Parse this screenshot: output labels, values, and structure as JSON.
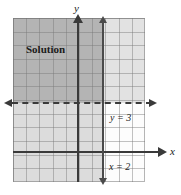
{
  "figure": {
    "type": "coordinate-plane-inequality-graph",
    "axis_labels": {
      "x": "x",
      "y": "y"
    },
    "region_label": "Solution",
    "boundary_lines": [
      {
        "id": "y3",
        "label": "y = 3",
        "style": "dashed",
        "orientation": "horizontal",
        "value": 3
      },
      {
        "id": "x2",
        "label": "x = 2",
        "style": "solid",
        "orientation": "vertical",
        "value": 2
      }
    ]
  },
  "chart_data": {
    "type": "line",
    "title": "",
    "xlabel": "x",
    "ylabel": "y",
    "grid": true,
    "legend": "none",
    "xlim": [
      -5,
      5
    ],
    "ylim": [
      -2,
      10
    ],
    "annotations": [
      {
        "text": "Solution",
        "x": -4,
        "y": 8
      },
      {
        "text": "y = 3",
        "x": 2.6,
        "y": 2.4
      },
      {
        "text": "x = 2",
        "x": 2.6,
        "y": -0.8
      }
    ],
    "series": [
      {
        "name": "y = 3",
        "type": "horizontal-line",
        "value": 3,
        "linestyle": "dashed",
        "color": "#3a3a3a"
      },
      {
        "name": "x = 2",
        "type": "vertical-line",
        "value": 2,
        "linestyle": "solid",
        "color": "#4a4a4a"
      }
    ],
    "shaded_regions": [
      {
        "name": "solution",
        "condition": "x < 2 and y > 3",
        "color": "#b4b4b4"
      },
      {
        "name": "upper-right",
        "condition": "x > 2 and y > 3",
        "color": "#e2e2e2"
      },
      {
        "name": "lower-left",
        "condition": "x < 2 and y < 3",
        "color": "#dcdcdc"
      },
      {
        "name": "lower-right",
        "condition": "x > 2 and y < 3",
        "color": "#fdfdfd"
      }
    ]
  },
  "colors": {
    "axis": "#3a3a3a",
    "gridline": "#787878",
    "solution_fill": "#b4b4b4",
    "background": "#ffffff"
  }
}
